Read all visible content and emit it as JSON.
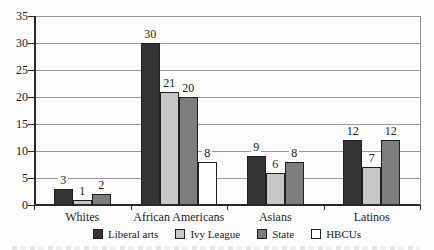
{
  "chart_data": {
    "type": "bar",
    "title": "",
    "xlabel": "",
    "ylabel": "",
    "categories": [
      "Whites",
      "African Americans",
      "Asians",
      "Latinos"
    ],
    "series": [
      {
        "name": "Liberal arts",
        "color": "#343434",
        "values": [
          3,
          30,
          9,
          12
        ]
      },
      {
        "name": "Ivy League",
        "color": "#c5c8c5",
        "values": [
          1,
          21,
          6,
          7
        ]
      },
      {
        "name": "State",
        "color": "#7d7d7d",
        "values": [
          2,
          20,
          8,
          12
        ]
      },
      {
        "name": "HBCUs",
        "color": "#ffffff",
        "values": [
          null,
          8,
          null,
          null
        ]
      }
    ],
    "ylim": [
      0,
      35
    ],
    "yticks": [
      0,
      5,
      10,
      15,
      20,
      25,
      30,
      35
    ],
    "grid": true,
    "bar_value_labels": true,
    "legend_position": "bottom-center",
    "axis_color": "#2a2a2a",
    "gridline_color": "#9b9b9b"
  }
}
